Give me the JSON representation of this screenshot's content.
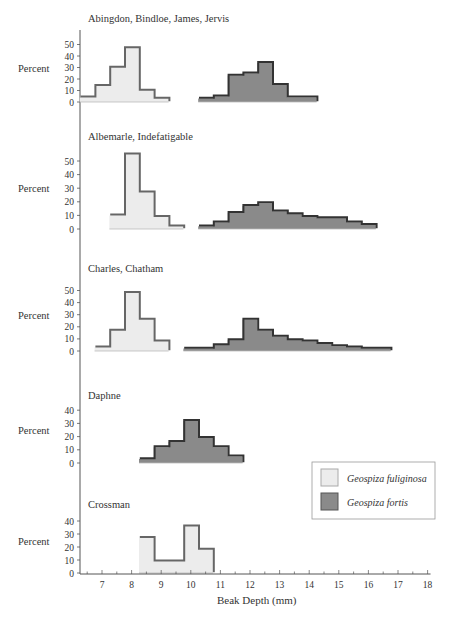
{
  "chart_data": {
    "type": "bar",
    "title": "",
    "xlabel": "Beak Depth (mm)",
    "ylabel": "Percent",
    "x_ticks": [
      7,
      8,
      9,
      10,
      11,
      12,
      13,
      14,
      15,
      16,
      17,
      18
    ],
    "xlim": [
      6.25,
      18.2
    ],
    "bin_width": 0.5,
    "legend": [
      {
        "name": "Geospiza fuliginosa",
        "color": "#ececec"
      },
      {
        "name": "Geospiza fortis",
        "color": "#8a8a8a"
      }
    ],
    "legend_position": "lower right",
    "panels": [
      {
        "title": "Abingdon, Bindloe, James, Jervis",
        "y_ticks": [
          0,
          10,
          20,
          30,
          40,
          50
        ],
        "series": [
          {
            "name": "Geospiza fuliginosa",
            "start": 6.25,
            "values": [
              4,
              14,
              30,
              47,
              10,
              3
            ]
          },
          {
            "name": "Geospiza fortis",
            "start": 10.25,
            "values": [
              3,
              5,
              23,
              25,
              34,
              15,
              4,
              4
            ]
          }
        ]
      },
      {
        "title": "Albemarle, Indefatigable",
        "y_ticks": [
          0,
          10,
          20,
          30,
          40,
          50
        ],
        "series": [
          {
            "name": "Geospiza fuliginosa",
            "start": 7.25,
            "values": [
              10,
              55,
              27,
              9,
              2
            ]
          },
          {
            "name": "Geospiza fortis",
            "start": 10.25,
            "values": [
              2,
              5,
              12,
              17,
              19,
              13,
              11,
              9,
              8,
              8,
              5,
              3
            ]
          }
        ]
      },
      {
        "title": "Charles, Chatham",
        "y_ticks": [
          0,
          10,
          20,
          30,
          40,
          50
        ],
        "series": [
          {
            "name": "Geospiza fuliginosa",
            "start": 6.75,
            "values": [
              3,
              17,
              48,
              26,
              8
            ]
          },
          {
            "name": "Geospiza fortis",
            "start": 9.75,
            "values": [
              2,
              2,
              5,
              9,
              26,
              17,
              12,
              9,
              8,
              6,
              4,
              3,
              2,
              2
            ]
          }
        ]
      },
      {
        "title": "Daphne",
        "y_ticks": [
          0,
          10,
          20,
          30,
          40
        ],
        "series": [
          {
            "name": "Geospiza fortis",
            "start": 8.25,
            "values": [
              3,
              12,
              16,
              32,
              19,
              12,
              5
            ]
          }
        ]
      },
      {
        "title": "Crossman",
        "y_ticks": [
          0,
          10,
          20,
          30,
          40
        ],
        "series": [
          {
            "name": "Geospiza fuliginosa",
            "start": 8.25,
            "values": [
              27,
              9,
              9,
              36,
              18
            ]
          }
        ]
      }
    ]
  }
}
